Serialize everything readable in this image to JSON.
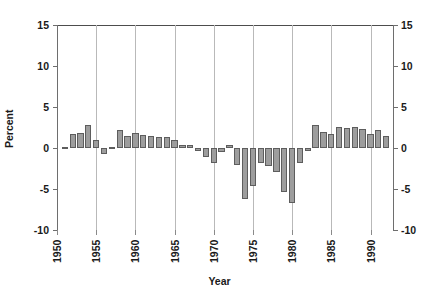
{
  "chart_data": {
    "type": "bar",
    "title": "",
    "subtitle": "",
    "xlabel": "Year",
    "ylabel": "Percent",
    "xlim": [
      1950,
      1993
    ],
    "ylim": [
      -10,
      15
    ],
    "ytick_labels": [
      "15",
      "10",
      "5",
      "0",
      "-5",
      "-10"
    ],
    "ytick_values": [
      15,
      10,
      5,
      0,
      -5,
      -10
    ],
    "xtick_labels": [
      "1950",
      "1955",
      "1960",
      "1965",
      "1970",
      "1975",
      "1980",
      "1985",
      "1990"
    ],
    "xtick_values": [
      1950,
      1955,
      1960,
      1965,
      1970,
      1975,
      1980,
      1985,
      1990
    ],
    "grid": "vertical-at-xticks",
    "legend": "none",
    "dual_y_axis": true,
    "bar_fill_color": "#9d9d9d",
    "bar_edge_color": "#5d5d5d",
    "gridline_color": "#b9b9b9",
    "axis_color": "#6e6e6e",
    "categories": [
      1951,
      1952,
      1953,
      1954,
      1955,
      1956,
      1957,
      1958,
      1959,
      1960,
      1961,
      1962,
      1963,
      1964,
      1965,
      1966,
      1967,
      1968,
      1969,
      1970,
      1971,
      1972,
      1973,
      1974,
      1975,
      1976,
      1977,
      1978,
      1979,
      1980,
      1981,
      1982,
      1983,
      1984,
      1985,
      1986,
      1987,
      1988,
      1989,
      1990,
      1991,
      1992
    ],
    "values": [
      0.1,
      1.7,
      1.8,
      2.8,
      1.0,
      -0.7,
      0.1,
      2.2,
      1.5,
      1.8,
      1.6,
      1.5,
      1.4,
      1.3,
      1.0,
      0.4,
      0.4,
      -0.4,
      -1.1,
      -1.8,
      -0.5,
      0.4,
      -2.1,
      -6.2,
      -4.6,
      -1.8,
      -2.2,
      -2.9,
      -5.4,
      -6.7,
      -1.8,
      -0.3,
      2.8,
      2.0,
      1.7,
      2.6,
      2.5,
      2.6,
      2.3,
      1.7,
      2.2,
      1.5
    ]
  }
}
